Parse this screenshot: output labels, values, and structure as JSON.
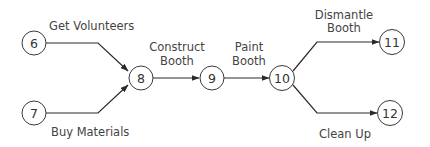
{
  "diagram": {
    "type": "activity-network",
    "nodes": [
      {
        "id": "6",
        "label": "6",
        "cx": 34,
        "cy": 43
      },
      {
        "id": "7",
        "label": "7",
        "cx": 34,
        "cy": 113
      },
      {
        "id": "8",
        "label": "8",
        "cx": 141,
        "cy": 78
      },
      {
        "id": "9",
        "label": "9",
        "cx": 212,
        "cy": 78
      },
      {
        "id": "10",
        "label": "10",
        "cx": 282,
        "cy": 78
      },
      {
        "id": "11",
        "label": "11",
        "cx": 392,
        "cy": 42
      },
      {
        "id": "12",
        "label": "12",
        "cx": 390,
        "cy": 113
      }
    ],
    "edges": [
      {
        "from": "6",
        "to": "8",
        "label_lines": [
          "Get Volunteers"
        ]
      },
      {
        "from": "7",
        "to": "8",
        "label_lines": [
          "Buy Materials"
        ]
      },
      {
        "from": "8",
        "to": "9",
        "label_lines": [
          "Construct",
          "Booth"
        ]
      },
      {
        "from": "9",
        "to": "10",
        "label_lines": [
          "Paint",
          "Booth"
        ]
      },
      {
        "from": "10",
        "to": "11",
        "label_lines": [
          "Dismantle",
          "Booth"
        ]
      },
      {
        "from": "10",
        "to": "12",
        "label_lines": [
          "Clean Up"
        ]
      }
    ],
    "colors": {
      "stroke": "#2a2a2a",
      "text": "#333333",
      "background": "#ffffff"
    }
  }
}
